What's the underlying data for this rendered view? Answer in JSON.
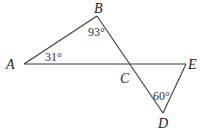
{
  "diagram": {
    "points": {
      "A": {
        "label": "A",
        "x": 24,
        "y": 64
      },
      "B": {
        "label": "B",
        "x": 97,
        "y": 16
      },
      "C": {
        "label": "C",
        "x": 131,
        "y": 64
      },
      "D": {
        "label": "D",
        "x": 163,
        "y": 113
      },
      "E": {
        "label": "E",
        "x": 186,
        "y": 64
      }
    },
    "segments": [
      "AE",
      "AB",
      "BD",
      "ED"
    ],
    "angles": {
      "A": {
        "label": "31°"
      },
      "B": {
        "label": "93°"
      },
      "D": {
        "label": "60°"
      }
    },
    "colors": {
      "stroke": "#3a3a3a",
      "text": "#222222"
    }
  }
}
